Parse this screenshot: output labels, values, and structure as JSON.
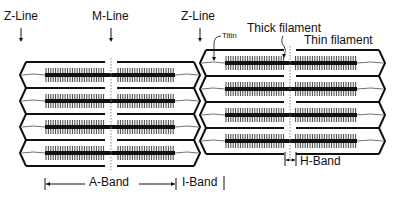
{
  "labels": {
    "z_line_left": "Z-Line",
    "m_line": "M-Line",
    "z_line_right": "Z-Line",
    "titin": "Titin",
    "thick_filament": "Thick filament",
    "thin_filament": "Thin filament",
    "a_band": "A-Band",
    "i_band": "I-Band",
    "h_band": "H-Band"
  },
  "colors": {
    "stroke": "#111111",
    "mline": "#888888",
    "background": "#ffffff"
  },
  "geometry": {
    "row_count": 4,
    "row_height": 26,
    "left_block": {
      "z_left": 20,
      "z_right": 200,
      "top": 62,
      "m_x": 111,
      "thick_start": 45,
      "thick_end": 175
    },
    "right_block": {
      "z_left": 200,
      "z_right": 385,
      "top": 50,
      "m_x": 290,
      "thick_start": 225,
      "thick_end": 357
    }
  }
}
